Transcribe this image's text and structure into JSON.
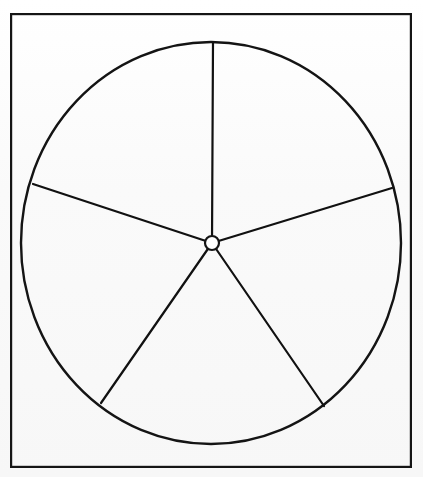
{
  "document": {
    "title": "Circle divided into five sectors",
    "background_color": "#fbfbfb",
    "ink_color": "#111111",
    "width": 423,
    "height": 477
  },
  "frame": {
    "name": "page-border",
    "x": 10,
    "y": 13,
    "width": 402,
    "height": 455,
    "stroke_width": 2.2,
    "stroke_color": "#151515",
    "fill": "none"
  },
  "wheel": {
    "label": "five-sector circle",
    "center_x": 211,
    "center_y": 243,
    "radius_x": 190,
    "radius_y": 201,
    "rim_stroke_width": 2.4,
    "rim_stroke_color": "#141414",
    "rim_fill": "none"
  },
  "hub": {
    "label": "center hub",
    "center_x": 212,
    "center_y": 243,
    "radius": 7,
    "stroke_width": 2.2,
    "stroke_color": "#141414",
    "fill": "#ffffff"
  },
  "spokes": [
    {
      "name": "spoke-north",
      "label": "vertical spoke to top",
      "angle_deg": 90,
      "x1": 212,
      "y1": 243,
      "x2": 213,
      "y2": 42,
      "stroke_width": 2.2
    },
    {
      "name": "spoke-upper-left",
      "label": "spoke to upper left rim",
      "angle_deg": 162,
      "x1": 212,
      "y1": 243,
      "x2": 33,
      "y2": 184,
      "stroke_width": 2.2
    },
    {
      "name": "spoke-upper-right",
      "label": "spoke to upper right rim",
      "angle_deg": 18,
      "x1": 212,
      "y1": 243,
      "x2": 392,
      "y2": 188,
      "stroke_width": 2.2
    },
    {
      "name": "spoke-lower-left",
      "label": "spoke to lower left rim",
      "angle_deg": 233,
      "x1": 212,
      "y1": 243,
      "x2": 101,
      "y2": 403,
      "stroke_width": 2.2
    },
    {
      "name": "spoke-lower-right",
      "label": "spoke to lower right rim",
      "angle_deg": 305,
      "x1": 212,
      "y1": 243,
      "x2": 324,
      "y2": 406,
      "stroke_width": 2.2
    }
  ],
  "chart_data": {
    "type": "pie",
    "title": "",
    "categories": [
      "Sector 1",
      "Sector 2",
      "Sector 3",
      "Sector 4",
      "Sector 5"
    ],
    "values": [
      72,
      72,
      72,
      72,
      72
    ],
    "value_unit": "degrees",
    "boundary_angles_deg": [
      90,
      162,
      233,
      305,
      18
    ],
    "slices": [
      {
        "name": "Sector 1",
        "start_deg": 18,
        "end_deg": 90,
        "span_deg": 72,
        "fill": "none"
      },
      {
        "name": "Sector 2",
        "start_deg": 90,
        "end_deg": 162,
        "span_deg": 72,
        "fill": "none"
      },
      {
        "name": "Sector 3",
        "start_deg": 162,
        "end_deg": 233,
        "span_deg": 71,
        "fill": "none"
      },
      {
        "name": "Sector 4",
        "start_deg": 233,
        "end_deg": 305,
        "span_deg": 72,
        "fill": "none"
      },
      {
        "name": "Sector 5",
        "start_deg": 305,
        "end_deg": 378,
        "span_deg": 73,
        "fill": "none"
      }
    ],
    "legend": [],
    "labels_shown": false,
    "grid": false,
    "outline_only": true
  }
}
